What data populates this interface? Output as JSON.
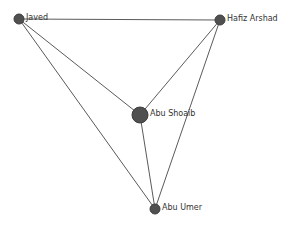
{
  "chart_data": {
    "type": "network",
    "title": "",
    "nodes": [
      {
        "id": "javed",
        "label": "Javed",
        "x": 19,
        "y": 19,
        "r": 5
      },
      {
        "id": "hafiz",
        "label": "Hafiz Arshad",
        "x": 220,
        "y": 20,
        "r": 5
      },
      {
        "id": "shoaib",
        "label": "Abu Shoaib",
        "x": 140,
        "y": 115,
        "r": 8
      },
      {
        "id": "umer",
        "label": "Abu Umer",
        "x": 155,
        "y": 209,
        "r": 5
      }
    ],
    "edges": [
      {
        "source": "javed",
        "target": "hafiz"
      },
      {
        "source": "javed",
        "target": "shoaib"
      },
      {
        "source": "javed",
        "target": "umer"
      },
      {
        "source": "hafiz",
        "target": "shoaib"
      },
      {
        "source": "hafiz",
        "target": "umer"
      },
      {
        "source": "shoaib",
        "target": "umer"
      }
    ]
  },
  "colors": {
    "node_fill": "#505050",
    "edge": "#5a5a5a",
    "label": "#333333",
    "background": "#ffffff"
  }
}
